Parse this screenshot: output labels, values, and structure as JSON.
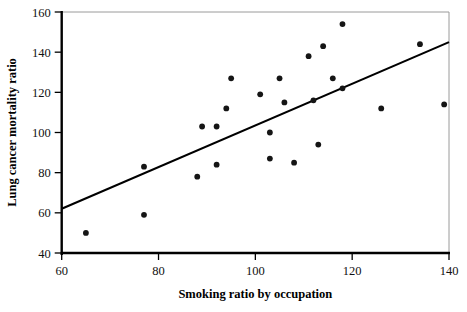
{
  "figure": {
    "background_color": "#ffffff",
    "point_color": "#151515",
    "line_color": "#000000",
    "axis_color": "#000000",
    "frame_color": "#9a9a9a"
  },
  "chart_data": {
    "type": "scatter",
    "title": "",
    "xlabel": "Smoking ratio by occupation",
    "ylabel": "Lung cancer mortality ratio",
    "xlim": [
      60,
      140
    ],
    "ylim": [
      40,
      160
    ],
    "xticks": [
      60,
      80,
      100,
      120,
      140
    ],
    "yticks": [
      40,
      60,
      80,
      100,
      120,
      140,
      160
    ],
    "xtick_labels": [
      "60",
      "80",
      "100",
      "120",
      "140"
    ],
    "ytick_labels": [
      "40",
      "60",
      "80",
      "100",
      "120",
      "140",
      "160"
    ],
    "grid": false,
    "legend": null,
    "series": [
      {
        "name": "Occupational groups",
        "marker": "filled-circle",
        "points": [
          {
            "x": 65,
            "y": 50
          },
          {
            "x": 77,
            "y": 59
          },
          {
            "x": 77,
            "y": 83
          },
          {
            "x": 88,
            "y": 78
          },
          {
            "x": 89,
            "y": 103
          },
          {
            "x": 92,
            "y": 84
          },
          {
            "x": 92,
            "y": 103
          },
          {
            "x": 94,
            "y": 112
          },
          {
            "x": 95,
            "y": 127
          },
          {
            "x": 101,
            "y": 119
          },
          {
            "x": 103,
            "y": 100
          },
          {
            "x": 103,
            "y": 87
          },
          {
            "x": 105,
            "y": 127
          },
          {
            "x": 106,
            "y": 115
          },
          {
            "x": 108,
            "y": 85
          },
          {
            "x": 111,
            "y": 138
          },
          {
            "x": 112,
            "y": 116
          },
          {
            "x": 113,
            "y": 94
          },
          {
            "x": 114,
            "y": 143
          },
          {
            "x": 116,
            "y": 127
          },
          {
            "x": 118,
            "y": 122
          },
          {
            "x": 118,
            "y": 154
          },
          {
            "x": 126,
            "y": 112
          },
          {
            "x": 134,
            "y": 144
          },
          {
            "x": 139,
            "y": 114
          }
        ]
      }
    ],
    "trendline": {
      "name": "least-squares regression line",
      "x_start": 60,
      "y_start": 62,
      "x_end": 140,
      "y_end": 145
    }
  }
}
